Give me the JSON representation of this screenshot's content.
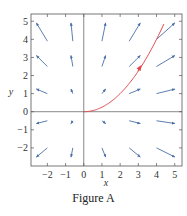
{
  "figure": {
    "caption": "Figure A",
    "xlabel": "x",
    "ylabel": "y"
  },
  "colors": {
    "arrow": "#4a6fa5",
    "curve": "#e0474c",
    "axis": "#555555",
    "frame": "#555555"
  },
  "chart_data": {
    "type": "line",
    "title": "",
    "caption": "Figure A",
    "xlabel": "x",
    "ylabel": "y",
    "xlim": [
      -2.9,
      5.4
    ],
    "ylim": [
      -3.0,
      5.4
    ],
    "grid": false,
    "xticks": [
      -2,
      -1,
      0,
      1,
      2,
      3,
      4,
      5
    ],
    "yticks": [
      -2,
      -1,
      0,
      1,
      2,
      3,
      4,
      5
    ],
    "xtick_labels": [
      "−2",
      "−1",
      "0",
      "1",
      "2",
      "3",
      "4",
      "5"
    ],
    "ytick_labels": [
      "−2",
      "−1",
      "0",
      "1",
      "2",
      "3",
      "4",
      "5"
    ],
    "series": [
      {
        "name": "solution curve",
        "color": "#e0474c",
        "x": [
          0,
          0.5,
          1,
          1.5,
          2,
          2.5,
          3,
          3.5,
          4,
          4.4
        ],
        "y": [
          0,
          0.06,
          0.25,
          0.56,
          1.0,
          1.56,
          2.25,
          3.06,
          4.0,
          4.84
        ],
        "direction_arrow_at": [
          3.1,
          2.45
        ]
      }
    ],
    "vector_field": {
      "color": "#4a6fa5",
      "arrows": [
        {
          "x0": -2.0,
          "y0": 3.9,
          "x1": -2.6,
          "y1": 4.9
        },
        {
          "x0": -0.6,
          "y0": 3.9,
          "x1": -0.7,
          "y1": 4.9
        },
        {
          "x0": 1.0,
          "y0": 3.9,
          "x1": 1.2,
          "y1": 4.9
        },
        {
          "x0": 2.5,
          "y0": 3.9,
          "x1": 3.1,
          "y1": 4.9
        },
        {
          "x0": 4.0,
          "y0": 4.0,
          "x1": 5.0,
          "y1": 4.9
        },
        {
          "x0": -2.0,
          "y0": 2.5,
          "x1": -2.6,
          "y1": 3.1
        },
        {
          "x0": -0.6,
          "y0": 2.5,
          "x1": -0.7,
          "y1": 3.1
        },
        {
          "x0": 1.0,
          "y0": 2.5,
          "x1": 1.2,
          "y1": 3.1
        },
        {
          "x0": 2.5,
          "y0": 2.5,
          "x1": 3.1,
          "y1": 3.1
        },
        {
          "x0": 4.0,
          "y0": 2.5,
          "x1": 5.0,
          "y1": 3.1
        },
        {
          "x0": -2.0,
          "y0": 1.0,
          "x1": -2.6,
          "y1": 1.25
        },
        {
          "x0": -0.6,
          "y0": 1.0,
          "x1": -0.7,
          "y1": 1.25
        },
        {
          "x0": 1.0,
          "y0": 1.0,
          "x1": 1.2,
          "y1": 1.25
        },
        {
          "x0": 2.5,
          "y0": 1.0,
          "x1": 3.1,
          "y1": 1.25
        },
        {
          "x0": 4.0,
          "y0": 1.0,
          "x1": 5.0,
          "y1": 1.25
        },
        {
          "x0": -2.0,
          "y0": -0.5,
          "x1": -2.6,
          "y1": -0.65
        },
        {
          "x0": -0.6,
          "y0": -0.5,
          "x1": -0.7,
          "y1": -0.65
        },
        {
          "x0": 1.0,
          "y0": -0.5,
          "x1": 1.2,
          "y1": -0.65
        },
        {
          "x0": 2.5,
          "y0": -0.5,
          "x1": 3.1,
          "y1": -0.65
        },
        {
          "x0": 4.0,
          "y0": -0.5,
          "x1": 5.0,
          "y1": -0.65
        },
        {
          "x0": -2.0,
          "y0": -2.0,
          "x1": -2.6,
          "y1": -2.5
        },
        {
          "x0": -0.6,
          "y0": -2.0,
          "x1": -0.7,
          "y1": -2.5
        },
        {
          "x0": 1.0,
          "y0": -2.0,
          "x1": 1.2,
          "y1": -2.5
        },
        {
          "x0": 2.5,
          "y0": -2.0,
          "x1": 3.1,
          "y1": -2.5
        },
        {
          "x0": 4.0,
          "y0": -2.0,
          "x1": 5.0,
          "y1": -2.5
        }
      ]
    }
  }
}
